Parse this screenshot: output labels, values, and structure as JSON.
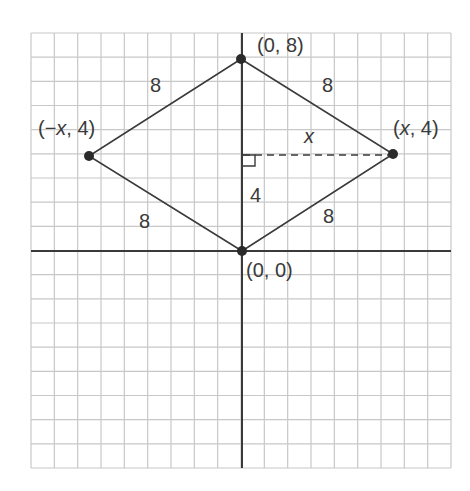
{
  "figure": {
    "type": "coordinate-grid-rhombus",
    "grid": {
      "columns": 18,
      "rows": 18,
      "x_min_units": -9,
      "x_max_units": 9,
      "y_min_units": -9,
      "y_max_units": 9
    },
    "colors": {
      "grid": "#c8c8c8",
      "axis": "#3a3a3a",
      "shape": "#3a3a3a",
      "text": "#3a3a3a"
    },
    "vertices": [
      {
        "id": "top",
        "label": "(0, 8)"
      },
      {
        "id": "right",
        "label_prefix": "(",
        "label_var": "x",
        "label_suffix": ", 4)"
      },
      {
        "id": "bottom",
        "label": "(0, 0)"
      },
      {
        "id": "left",
        "label_prefix": "(−",
        "label_var": "x",
        "label_suffix": ", 4)"
      }
    ],
    "side_lengths": {
      "top_left": "8",
      "top_right": "8",
      "bottom_left": "8",
      "bottom_right": "8"
    },
    "height_label": "4",
    "half_width_label": "x"
  }
}
